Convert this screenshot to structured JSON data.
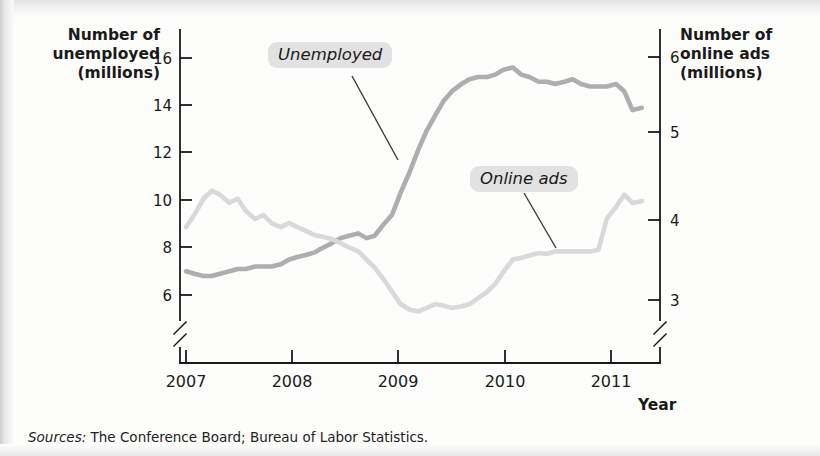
{
  "axes": {
    "left_title": "Number of\nunemployed\n(millions)",
    "right_title": "Number of\nonline ads\n(millions)",
    "x_title": "Year"
  },
  "sources": {
    "label": "Sources:",
    "text": " The Conference Board; Bureau of Labor Statistics."
  },
  "callouts": {
    "unemployed": "Unemployed",
    "online_ads": "Online ads"
  },
  "colors": {
    "unemployed_line": "#aeaeae",
    "online_ads_line": "#d9d9d9",
    "axis": "#1a1a1a",
    "callout_bg": "#e2e2e2",
    "page_bg": "#fdfdfc"
  },
  "chart_data": {
    "type": "line",
    "title": "",
    "xlabel": "Year",
    "grid": false,
    "legend_position": "inline-callouts",
    "x_ticks": [
      "2007",
      "2008",
      "2009",
      "2010",
      "2011"
    ],
    "x_range": [
      2007.0,
      2011.5
    ],
    "y_left": {
      "label": "Number of unemployed (millions)",
      "ticks": [
        6,
        8,
        10,
        12,
        14,
        16
      ],
      "range": [
        5.2,
        16.8
      ],
      "axis_break": true
    },
    "y_right": {
      "label": "Number of online ads (millions)",
      "ticks": [
        3,
        4,
        5,
        6
      ],
      "range": [
        2.55,
        6.2
      ],
      "axis_break": true
    },
    "series": [
      {
        "name": "Unemployed",
        "axis": "left",
        "color": "#aeaeae",
        "units": "millions",
        "x": [
          2007.0,
          2007.08,
          2007.17,
          2007.25,
          2007.33,
          2007.42,
          2007.5,
          2007.58,
          2007.67,
          2007.75,
          2007.83,
          2007.92,
          2008.0,
          2008.08,
          2008.17,
          2008.25,
          2008.33,
          2008.42,
          2008.5,
          2008.58,
          2008.67,
          2008.75,
          2008.83,
          2008.92,
          2009.0,
          2009.08,
          2009.17,
          2009.25,
          2009.33,
          2009.42,
          2009.5,
          2009.58,
          2009.67,
          2009.75,
          2009.83,
          2009.92,
          2010.0,
          2010.08,
          2010.17,
          2010.25,
          2010.33,
          2010.42,
          2010.5,
          2010.58,
          2010.67,
          2010.75,
          2010.83,
          2010.92,
          2011.0,
          2011.08,
          2011.17,
          2011.25,
          2011.33,
          2011.42
        ],
        "y": [
          7.0,
          6.9,
          6.8,
          6.8,
          6.9,
          7.0,
          7.1,
          7.1,
          7.2,
          7.2,
          7.2,
          7.3,
          7.5,
          7.6,
          7.7,
          7.8,
          8.0,
          8.2,
          8.4,
          8.5,
          8.6,
          8.4,
          8.5,
          9.0,
          9.4,
          10.3,
          11.2,
          12.1,
          12.9,
          13.6,
          14.2,
          14.6,
          14.9,
          15.1,
          15.2,
          15.2,
          15.3,
          15.5,
          15.6,
          15.3,
          15.2,
          15.0,
          15.0,
          14.9,
          15.0,
          15.1,
          14.9,
          14.8,
          14.8,
          14.8,
          14.9,
          14.6,
          13.8,
          13.9
        ],
        "peak": {
          "x": 2009.83,
          "y": 15.6
        },
        "start": {
          "x": 2007.0,
          "y": 7.0
        },
        "end": {
          "x": 2011.42,
          "y": 13.9
        }
      },
      {
        "name": "Online ads",
        "axis": "right",
        "color": "#d9d9d9",
        "units": "millions",
        "x": [
          2007.0,
          2007.08,
          2007.17,
          2007.25,
          2007.33,
          2007.42,
          2007.5,
          2007.58,
          2007.67,
          2007.75,
          2007.83,
          2007.92,
          2008.0,
          2008.08,
          2008.17,
          2008.25,
          2008.33,
          2008.42,
          2008.5,
          2008.58,
          2008.67,
          2008.75,
          2008.83,
          2008.92,
          2009.0,
          2009.08,
          2009.17,
          2009.25,
          2009.33,
          2009.42,
          2009.5,
          2009.58,
          2009.67,
          2009.75,
          2009.83,
          2009.92,
          2010.0,
          2010.08,
          2010.17,
          2010.25,
          2010.33,
          2010.42,
          2010.5,
          2010.58,
          2010.67,
          2010.75,
          2010.83,
          2010.92,
          2011.0,
          2011.08,
          2011.17,
          2011.25,
          2011.33,
          2011.42
        ],
        "y": [
          3.9,
          4.05,
          4.25,
          4.35,
          4.3,
          4.2,
          4.25,
          4.1,
          4.0,
          4.05,
          3.95,
          3.9,
          3.95,
          3.9,
          3.85,
          3.8,
          3.78,
          3.75,
          3.7,
          3.65,
          3.6,
          3.5,
          3.4,
          3.25,
          3.1,
          2.95,
          2.88,
          2.86,
          2.9,
          2.95,
          2.93,
          2.9,
          2.92,
          2.95,
          3.02,
          3.1,
          3.2,
          3.35,
          3.5,
          3.52,
          3.55,
          3.58,
          3.57,
          3.6,
          3.6,
          3.6,
          3.6,
          3.6,
          3.62,
          4.0,
          4.15,
          4.3,
          4.2,
          4.22
        ],
        "peak": {
          "x": 2007.25,
          "y": 4.35
        },
        "trough": {
          "x": 2009.25,
          "y": 2.86
        },
        "start": {
          "x": 2007.0,
          "y": 3.9
        },
        "end": {
          "x": 2011.42,
          "y": 4.22
        }
      }
    ],
    "annotations": [
      {
        "text": "Unemployed",
        "points_to_series": "Unemployed"
      },
      {
        "text": "Online ads",
        "points_to_series": "Online ads"
      }
    ]
  }
}
